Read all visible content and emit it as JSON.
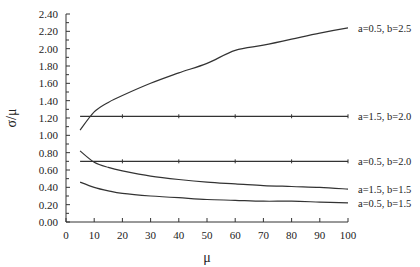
{
  "chart_data": {
    "type": "line",
    "title": "",
    "xlabel": "μ",
    "ylabel": "σ/μ",
    "xlim": [
      0,
      100
    ],
    "ylim": [
      0,
      2.4
    ],
    "x_ticks": [
      "0",
      "10",
      "20",
      "30",
      "40",
      "50",
      "60",
      "70",
      "80",
      "90",
      "100"
    ],
    "y_ticks": [
      "0.00",
      "0.20",
      "0.40",
      "0.60",
      "0.80",
      "1.00",
      "1.20",
      "1.40",
      "1.60",
      "1.80",
      "2.00",
      "2.20",
      "2.40"
    ],
    "grid": false,
    "legend_position": "inline-right",
    "x": [
      5,
      10,
      15,
      20,
      30,
      40,
      50,
      60,
      70,
      80,
      90,
      100
    ],
    "series": [
      {
        "name": "a=0.5, b=2.5",
        "values": [
          1.06,
          1.27,
          1.38,
          1.46,
          1.6,
          1.72,
          1.83,
          1.98,
          2.04,
          2.11,
          2.18,
          2.24
        ]
      },
      {
        "name": "a=1.5, b=2.0",
        "values": [
          1.22,
          1.22,
          1.22,
          1.22,
          1.22,
          1.22,
          1.22,
          1.22,
          1.22,
          1.22,
          1.22,
          1.22
        ]
      },
      {
        "name": "a=0.5, b=2.0",
        "values": [
          0.7,
          0.7,
          0.7,
          0.7,
          0.7,
          0.7,
          0.7,
          0.7,
          0.7,
          0.7,
          0.7,
          0.7
        ]
      },
      {
        "name": "a=1.5, b=1.5",
        "values": [
          0.82,
          0.69,
          0.63,
          0.59,
          0.53,
          0.49,
          0.46,
          0.44,
          0.42,
          0.41,
          0.4,
          0.38
        ]
      },
      {
        "name": "a=0.5, b=1.5",
        "values": [
          0.46,
          0.4,
          0.36,
          0.33,
          0.3,
          0.28,
          0.26,
          0.25,
          0.24,
          0.24,
          0.23,
          0.22
        ]
      }
    ]
  }
}
